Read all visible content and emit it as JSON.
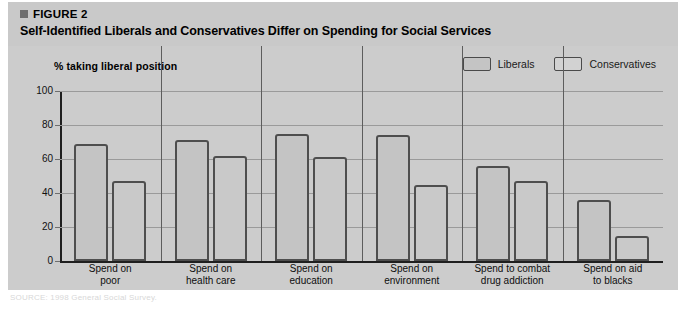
{
  "figure": {
    "label": "FIGURE 2",
    "title": "Self-Identified Liberals and Conservatives Differ on Spending for Social Services",
    "bullet_color": "#6e6e6e",
    "header_bg": "#c9c9c9",
    "panel_bg": "#cccccc"
  },
  "legend": {
    "position": "top-right",
    "items": [
      {
        "label": "Liberals",
        "swatch": "liberals-swatch",
        "color": "#c4c4c4"
      },
      {
        "label": "Conservatives",
        "swatch": "conservatives-swatch",
        "color": "#d2d2d2"
      }
    ]
  },
  "axis": {
    "y_caption": "% taking liberal position",
    "y_ticks": [
      "100",
      "80",
      "60",
      "40",
      "20",
      "0"
    ]
  },
  "source": {
    "text": "SOURCE: 1998 General Social Survey."
  },
  "chart_data": {
    "type": "bar",
    "title": "Self-Identified Liberals and Conservatives Differ on Spending for Social Services",
    "xlabel": "",
    "ylabel": "% taking liberal position",
    "ylim": [
      0,
      100
    ],
    "yticks": [
      0,
      20,
      40,
      60,
      80,
      100
    ],
    "grid": true,
    "legend_position": "top-right",
    "categories": [
      "Spend on poor",
      "Spend on health care",
      "Spend on education",
      "Spend on environment",
      "Spend to combat drug addiction",
      "Spend on aid to blacks"
    ],
    "category_lines": [
      [
        "Spend on",
        "poor"
      ],
      [
        "Spend on",
        "health care"
      ],
      [
        "Spend on",
        "education"
      ],
      [
        "Spend on",
        "environment"
      ],
      [
        "Spend to combat",
        "drug addiction"
      ],
      [
        "Spend on aid",
        "to blacks"
      ]
    ],
    "series": [
      {
        "name": "Liberals",
        "values": [
          69,
          71,
          75,
          74,
          56,
          36
        ]
      },
      {
        "name": "Conservatives",
        "values": [
          47,
          62,
          61,
          45,
          47,
          15
        ]
      }
    ]
  }
}
